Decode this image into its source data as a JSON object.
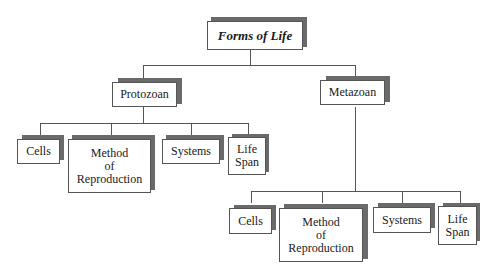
{
  "diagram": {
    "type": "hierarchy",
    "root": {
      "label": "Forms of Life"
    },
    "level1": [
      {
        "label": "Protozoan"
      },
      {
        "label": "Metazoan"
      }
    ],
    "protozoan_children": [
      {
        "label": "Cells"
      },
      {
        "label": "Method of Reproduction",
        "lines": [
          "Method",
          "of",
          "Reproduction"
        ]
      },
      {
        "label": "Systems"
      },
      {
        "label": "Life Span",
        "lines": [
          "Life",
          "Span"
        ]
      }
    ],
    "metazoan_children": [
      {
        "label": "Cells"
      },
      {
        "label": "Method of Reproduction",
        "lines": [
          "Method",
          "of",
          "Reproduction"
        ]
      },
      {
        "label": "Systems"
      },
      {
        "label": "Life Span",
        "lines": [
          "Life",
          "Span"
        ]
      }
    ]
  }
}
